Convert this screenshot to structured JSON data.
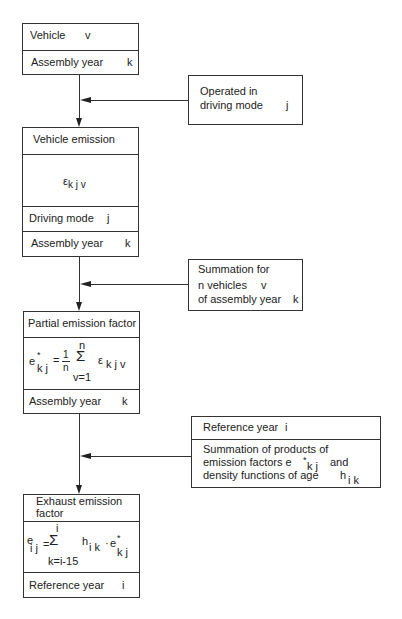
{
  "diagram": {
    "main_boxes": [
      {
        "id": "vehicle",
        "cells": [
          {
            "text": "Vehicle",
            "var": "v"
          },
          {
            "text": "Assembly year",
            "var": "k"
          }
        ]
      },
      {
        "id": "vehicle-emission",
        "cells": [
          {
            "text": "Vehicle emission"
          },
          {
            "formula": "ε k j v",
            "symbol": "ε",
            "subscript": "k j v"
          },
          {
            "text": "Driving mode",
            "var": "j"
          },
          {
            "text": "Assembly year",
            "var": "k"
          }
        ]
      },
      {
        "id": "partial-emission-factor",
        "cells": [
          {
            "text": "Partial emission factor"
          },
          {
            "formula": "e*kj = 1/n Σ(v=1..n) ε k j v",
            "lhs": "e",
            "lhs_sup": "*",
            "lhs_sub": "k j",
            "frac_num": "1",
            "frac_den": "n",
            "sum_upper": "n",
            "sum_lower": "v=1",
            "term": "ε",
            "term_sub": "k j v"
          },
          {
            "text": "Assembly year",
            "var": "k"
          }
        ]
      },
      {
        "id": "exhaust-emission-factor",
        "cells": [
          {
            "text": "Exhaust emission factor",
            "line1": "Exhaust emission",
            "line2": "factor"
          },
          {
            "formula": "e ij = Σ(k=i-15..i) h ik · e*kj",
            "lhs": "e",
            "lhs_sub": "i j",
            "sum_upper": "i",
            "sum_lower": "k=i-15",
            "h": "h",
            "h_sub": "i k",
            "dot": "·",
            "e2": "e",
            "e2_sup": "*",
            "e2_sub": "k j"
          },
          {
            "text": "Reference year",
            "var": "i"
          }
        ]
      }
    ],
    "side_boxes": [
      {
        "id": "operated-in-driving-mode",
        "lines": [
          "Operated in",
          "driving mode"
        ],
        "var": "j"
      },
      {
        "id": "summation-for-vehicles",
        "lines": [
          "Summation for",
          "n vehicles",
          "of assembly year"
        ],
        "vars": [
          "v",
          "k"
        ]
      },
      {
        "id": "reference-year-summation",
        "header": "Reference year",
        "header_var": "i",
        "lines": [
          "Summation of products of",
          "emission factors e",
          "and",
          "density functions of age",
          "h"
        ],
        "e_sup": "*",
        "e_sub": "k j",
        "h_sub": "i k"
      }
    ]
  }
}
